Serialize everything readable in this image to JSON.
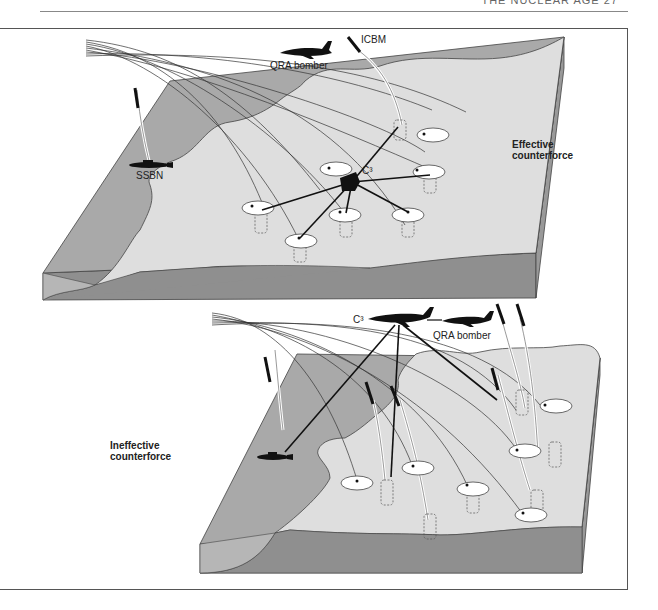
{
  "page_header": {
    "text": "THE NUCLEAR AGE 27"
  },
  "figure": {
    "panels": [
      {
        "id": "effective",
        "title_line1": "Effective",
        "title_line2": "counterforce",
        "labels": {
          "icbm": "ICBM",
          "bomber": "QRA bomber",
          "ssbn": "SSBN",
          "c3": "C³"
        }
      },
      {
        "id": "ineffective",
        "title_line1": "Ineffective",
        "title_line2": "counterforce",
        "labels": {
          "c3": "C³",
          "bomber": "QRA bomber"
        }
      }
    ],
    "colors": {
      "sea": "#a9a9a9",
      "land": "#dedede",
      "side_front": "#8f8f8f",
      "side_right": "#999999",
      "target": "#ffffff",
      "ink": "#111111"
    }
  }
}
